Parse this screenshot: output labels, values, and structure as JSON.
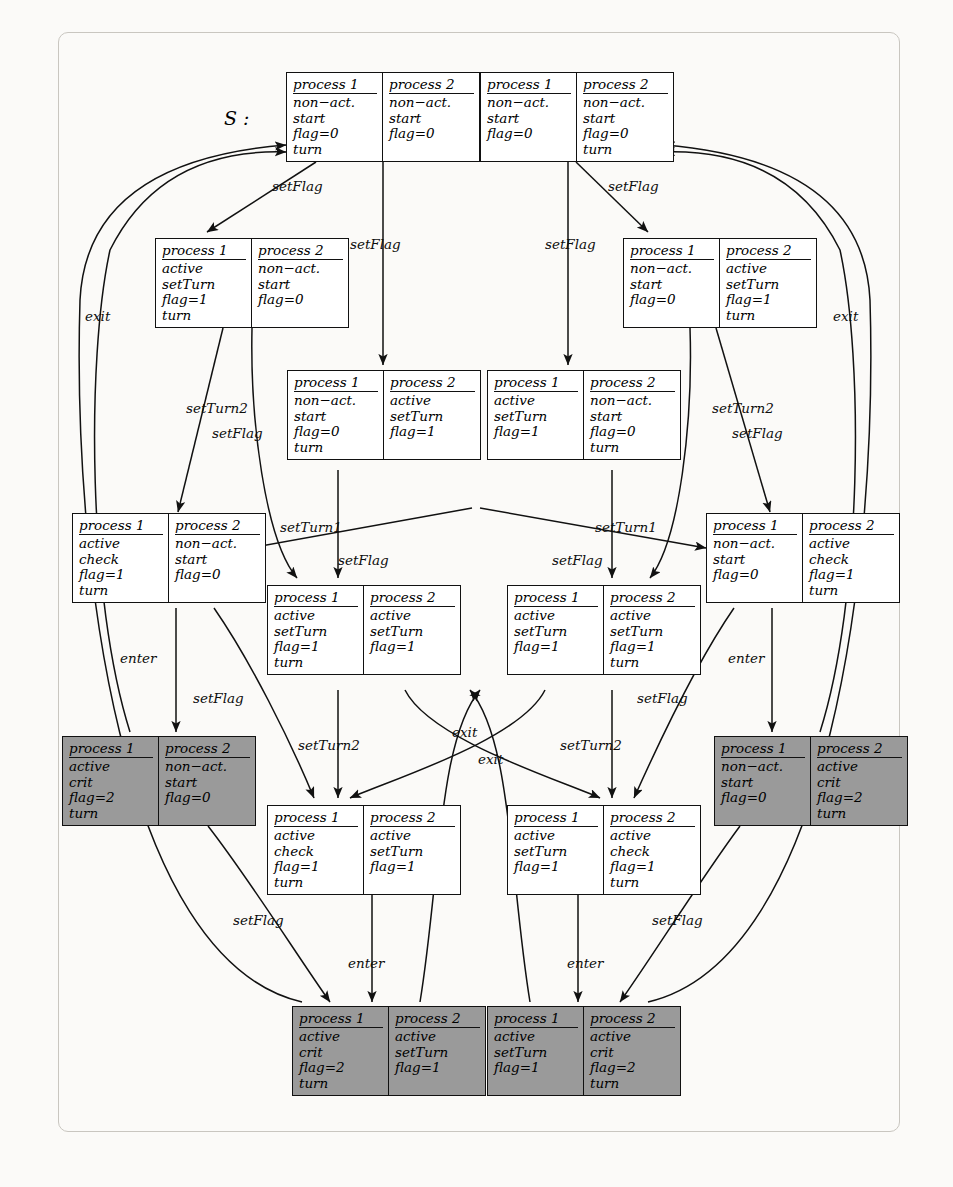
{
  "figure": {
    "start_label": "S :",
    "column_headers": [
      "process 1",
      "process 2"
    ],
    "shaded_color": "#9a9a9a",
    "node_color": "#ffffff",
    "line_color": "#111111"
  },
  "nodes": [
    {
      "id": "n0",
      "shaded": false,
      "left": [
        "non−act.",
        "start",
        "flag=0",
        "turn"
      ],
      "right": [
        "non−act.",
        "start",
        "flag=0",
        ""
      ]
    },
    {
      "id": "n1",
      "shaded": false,
      "left": [
        "non−act.",
        "start",
        "flag=0",
        ""
      ],
      "right": [
        "non−act.",
        "start",
        "flag=0",
        "turn"
      ]
    },
    {
      "id": "n2",
      "shaded": false,
      "left": [
        "active",
        "setTurn",
        "flag=1",
        "turn"
      ],
      "right": [
        "non−act.",
        "start",
        "flag=0",
        ""
      ]
    },
    {
      "id": "n3",
      "shaded": false,
      "left": [
        "non−act.",
        "start",
        "flag=0",
        ""
      ],
      "right": [
        "active",
        "setTurn",
        "flag=1",
        "turn"
      ]
    },
    {
      "id": "n4",
      "shaded": false,
      "left": [
        "non−act.",
        "start",
        "flag=0",
        "turn"
      ],
      "right": [
        "active",
        "setTurn",
        "flag=1",
        ""
      ]
    },
    {
      "id": "n5",
      "shaded": false,
      "left": [
        "active",
        "setTurn",
        "flag=1",
        ""
      ],
      "right": [
        "non−act.",
        "start",
        "flag=0",
        "turn"
      ]
    },
    {
      "id": "n6",
      "shaded": false,
      "left": [
        "active",
        "check",
        "flag=1",
        "turn"
      ],
      "right": [
        "non−act.",
        "start",
        "flag=0",
        ""
      ]
    },
    {
      "id": "n7",
      "shaded": false,
      "left": [
        "non−act.",
        "start",
        "flag=0",
        ""
      ],
      "right": [
        "active",
        "check",
        "flag=1",
        "turn"
      ]
    },
    {
      "id": "n8",
      "shaded": false,
      "left": [
        "active",
        "setTurn",
        "flag=1",
        "turn"
      ],
      "right": [
        "active",
        "setTurn",
        "flag=1",
        ""
      ]
    },
    {
      "id": "n9",
      "shaded": false,
      "left": [
        "active",
        "setTurn",
        "flag=1",
        ""
      ],
      "right": [
        "active",
        "setTurn",
        "flag=1",
        "turn"
      ]
    },
    {
      "id": "n10",
      "shaded": true,
      "left": [
        "active",
        "crit",
        "flag=2",
        "turn"
      ],
      "right": [
        "non−act.",
        "start",
        "flag=0",
        ""
      ]
    },
    {
      "id": "n11",
      "shaded": true,
      "left": [
        "non−act.",
        "start",
        "flag=0",
        ""
      ],
      "right": [
        "active",
        "crit",
        "flag=2",
        "turn"
      ]
    },
    {
      "id": "n12",
      "shaded": false,
      "left": [
        "active",
        "check",
        "flag=1",
        "turn"
      ],
      "right": [
        "active",
        "setTurn",
        "flag=1",
        ""
      ]
    },
    {
      "id": "n13",
      "shaded": false,
      "left": [
        "active",
        "setTurn",
        "flag=1",
        ""
      ],
      "right": [
        "active",
        "check",
        "flag=1",
        "turn"
      ]
    },
    {
      "id": "n14",
      "shaded": true,
      "left": [
        "active",
        "crit",
        "flag=2",
        "turn"
      ],
      "right": [
        "active",
        "setTurn",
        "flag=1",
        ""
      ]
    },
    {
      "id": "n15",
      "shaded": true,
      "left": [
        "active",
        "setTurn",
        "flag=1",
        ""
      ],
      "right": [
        "active",
        "crit",
        "flag=2",
        "turn"
      ]
    }
  ],
  "edge_labels": [
    {
      "id": "e1",
      "text": "setFlag",
      "x": 272,
      "y": 178
    },
    {
      "id": "e2",
      "text": "setFlag",
      "x": 350,
      "y": 236
    },
    {
      "id": "e3",
      "text": "setFlag",
      "x": 608,
      "y": 178
    },
    {
      "id": "e4",
      "text": "setFlag",
      "x": 545,
      "y": 236
    },
    {
      "id": "e5",
      "text": "exit",
      "x": 85,
      "y": 308
    },
    {
      "id": "e6",
      "text": "exit",
      "x": 833,
      "y": 308
    },
    {
      "id": "e7",
      "text": "setTurn2",
      "x": 186,
      "y": 400
    },
    {
      "id": "e8",
      "text": "setFlag",
      "x": 212,
      "y": 425
    },
    {
      "id": "e9",
      "text": "setTurn2",
      "x": 712,
      "y": 400
    },
    {
      "id": "e10",
      "text": "setFlag",
      "x": 732,
      "y": 425
    },
    {
      "id": "e11",
      "text": "setTurn1",
      "x": 280,
      "y": 519
    },
    {
      "id": "e12",
      "text": "setTurn1",
      "x": 595,
      "y": 519
    },
    {
      "id": "e13",
      "text": "setFlag",
      "x": 338,
      "y": 552
    },
    {
      "id": "e14",
      "text": "setFlag",
      "x": 552,
      "y": 552
    },
    {
      "id": "e15",
      "text": "enter",
      "x": 120,
      "y": 650
    },
    {
      "id": "e16",
      "text": "enter",
      "x": 728,
      "y": 650
    },
    {
      "id": "e17",
      "text": "setFlag",
      "x": 193,
      "y": 690
    },
    {
      "id": "e18",
      "text": "setFlag",
      "x": 637,
      "y": 690
    },
    {
      "id": "e19",
      "text": "setTurn2",
      "x": 298,
      "y": 737
    },
    {
      "id": "e20",
      "text": "setTurn2",
      "x": 560,
      "y": 737
    },
    {
      "id": "e21",
      "text": "exit",
      "x": 452,
      "y": 724
    },
    {
      "id": "e22",
      "text": "exit",
      "x": 478,
      "y": 751
    },
    {
      "id": "e23",
      "text": "setFlag",
      "x": 233,
      "y": 912
    },
    {
      "id": "e24",
      "text": "setFlag",
      "x": 652,
      "y": 912
    },
    {
      "id": "e25",
      "text": "enter",
      "x": 348,
      "y": 955
    },
    {
      "id": "e26",
      "text": "enter",
      "x": 567,
      "y": 955
    }
  ]
}
